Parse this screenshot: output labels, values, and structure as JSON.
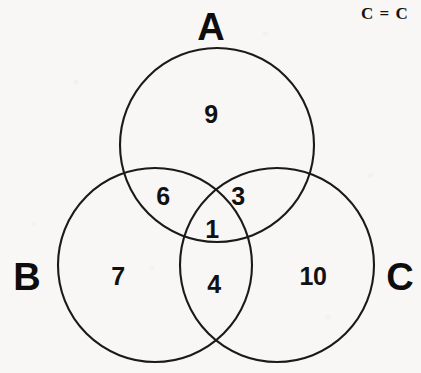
{
  "figure": {
    "type": "venn-diagram",
    "set_count": 3,
    "background_color": "#f8f7f5",
    "stroke_color": "#1a1a1a"
  },
  "annotation": {
    "equation_text": "C = C",
    "clipped_at_right_edge": true
  },
  "sets": [
    {
      "id": "A",
      "label": "A",
      "label_x": 211,
      "label_y": 27,
      "cx": 217,
      "cy": 145,
      "r": 97
    },
    {
      "id": "B",
      "label": "B",
      "label_x": 27,
      "label_y": 277,
      "cx": 155,
      "cy": 265,
      "r": 97
    },
    {
      "id": "C",
      "label": "C",
      "label_x": 400,
      "label_y": 277,
      "cx": 277,
      "cy": 265,
      "r": 97
    }
  ],
  "regions": [
    {
      "id": "A-only",
      "sets": "A",
      "value": "9",
      "x": 211,
      "y": 114
    },
    {
      "id": "A-and-B",
      "sets": "A,B",
      "value": "6",
      "x": 163,
      "y": 196
    },
    {
      "id": "A-and-C",
      "sets": "A,C",
      "value": "3",
      "x": 238,
      "y": 196
    },
    {
      "id": "A-B-and-C",
      "sets": "A,B,C",
      "value": "1",
      "x": 212,
      "y": 229
    },
    {
      "id": "B-only",
      "sets": "B",
      "value": "7",
      "x": 118,
      "y": 276
    },
    {
      "id": "B-and-C",
      "sets": "B,C",
      "value": "4",
      "x": 214,
      "y": 284
    },
    {
      "id": "C-only",
      "sets": "C",
      "value": "10",
      "x": 313,
      "y": 276
    }
  ],
  "chart_data": {
    "type": "venn",
    "title": "",
    "set_labels": [
      "A",
      "B",
      "C"
    ],
    "region_labels": [
      "A only",
      "A∩B only",
      "A∩C only",
      "A∩B∩C",
      "B only",
      "B∩C only",
      "C only"
    ],
    "region_values": [
      9,
      6,
      3,
      1,
      7,
      4,
      10
    ],
    "total": 40,
    "set_totals": {
      "A": 19,
      "B": 18,
      "C": 18
    },
    "legend": "none",
    "grid": false
  }
}
